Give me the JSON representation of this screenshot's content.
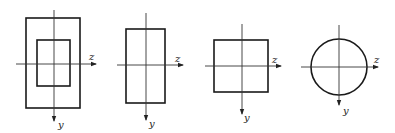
{
  "figures": [
    {
      "id": "hollow-rectangle",
      "shape": "hollow rectangle",
      "axis_z": "z",
      "axis_y": "y",
      "outer": {
        "x": 26,
        "y": 18,
        "w": 54,
        "h": 90
      },
      "inner": {
        "x": 37,
        "y": 40,
        "w": 33,
        "h": 46
      },
      "vaxis": {
        "x": 54,
        "y1": 10,
        "y2": 122
      },
      "haxis": {
        "y": 64,
        "x1": 16,
        "x2": 96
      }
    },
    {
      "id": "rectangle",
      "shape": "solid rectangle",
      "axis_z": "z",
      "axis_y": "y",
      "rect": {
        "x": 126,
        "y": 29,
        "w": 39,
        "h": 74
      },
      "vaxis": {
        "x": 146,
        "y1": 13,
        "y2": 121
      },
      "haxis": {
        "y": 65,
        "x1": 117,
        "x2": 183
      }
    },
    {
      "id": "square",
      "shape": "solid square",
      "axis_z": "z",
      "axis_y": "y",
      "rect": {
        "x": 214,
        "y": 40,
        "w": 54,
        "h": 52
      },
      "vaxis": {
        "x": 242,
        "y1": 24,
        "y2": 115
      },
      "haxis": {
        "y": 66,
        "x1": 205,
        "x2": 281
      }
    },
    {
      "id": "circle",
      "shape": "solid circle",
      "axis_z": "z",
      "axis_y": "y",
      "circle": {
        "cx": 339,
        "cy": 67,
        "r": 28
      },
      "vaxis": {
        "x": 339,
        "y1": 25,
        "y2": 106
      },
      "haxis": {
        "y": 67,
        "x1": 301,
        "x2": 378
      }
    }
  ]
}
